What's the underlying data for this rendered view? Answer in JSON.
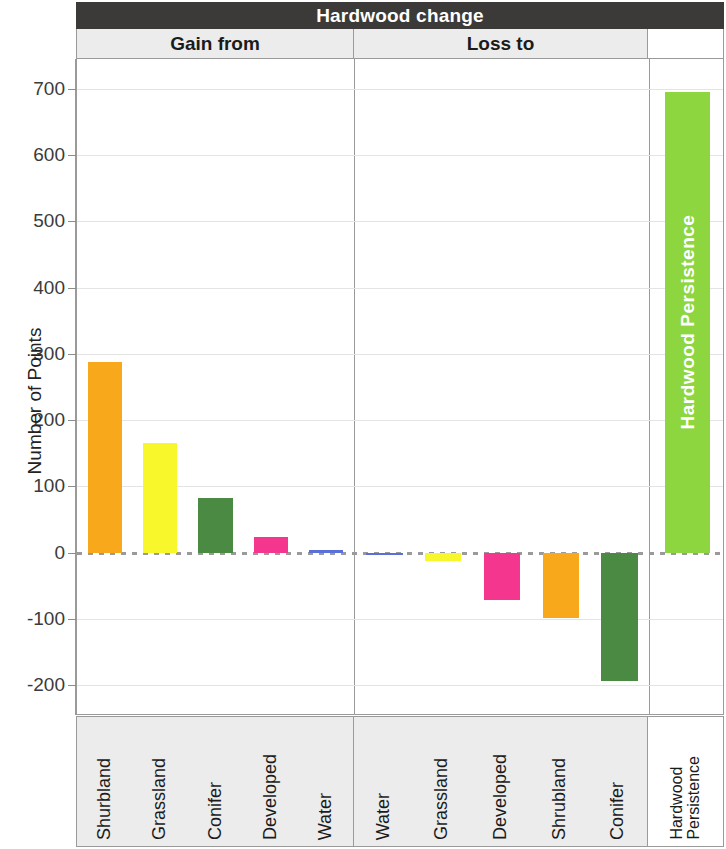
{
  "title": "Hardwood change",
  "groups": {
    "gain_label": "Gain from",
    "loss_label": "Loss to",
    "persistence_label": ""
  },
  "axes": {
    "y_title": "Number of Points",
    "y_ticks": [
      700,
      600,
      500,
      400,
      300,
      200,
      100,
      0,
      -100,
      -200
    ],
    "y_min": -245,
    "y_max": 745
  },
  "colors": {
    "shrubland": "#F7A81B",
    "grassland": "#F7F72B",
    "conifer": "#4A8A43",
    "developed": "#F5368F",
    "water": "#5B6FD8",
    "persistence": "#8DD63F",
    "title_bar": "#3b3a38",
    "header_band": "#ececec",
    "gridline": "#e4e4e4",
    "zeroline": "#9a9a9a"
  },
  "persistence_bar_label": "Hardwood Persistence",
  "chart_data": {
    "type": "bar",
    "title": "Hardwood change",
    "xlabel": "",
    "ylabel": "Number of Points",
    "ylim": [
      -245,
      745
    ],
    "grid": true,
    "legend": "none",
    "panels": [
      {
        "name": "Gain from",
        "categories": [
          "Shurbland",
          "Grassland",
          "Conifer",
          "Developed",
          "Water"
        ],
        "values": [
          288,
          165,
          83,
          23,
          4
        ],
        "colors": [
          "#F7A81B",
          "#F7F72B",
          "#4A8A43",
          "#F5368F",
          "#5B6FD8"
        ]
      },
      {
        "name": "Loss to",
        "categories": [
          "Water",
          "Grassland",
          "Developed",
          "Shrubland",
          "Conifer"
        ],
        "values": [
          -4,
          -12,
          -72,
          -99,
          -194
        ],
        "colors": [
          "#5B6FD8",
          "#F7F72B",
          "#F5368F",
          "#F7A81B",
          "#4A8A43"
        ]
      },
      {
        "name": "",
        "categories": [
          "Hardwood Persistence"
        ],
        "values": [
          695
        ],
        "colors": [
          "#8DD63F"
        ]
      }
    ]
  }
}
